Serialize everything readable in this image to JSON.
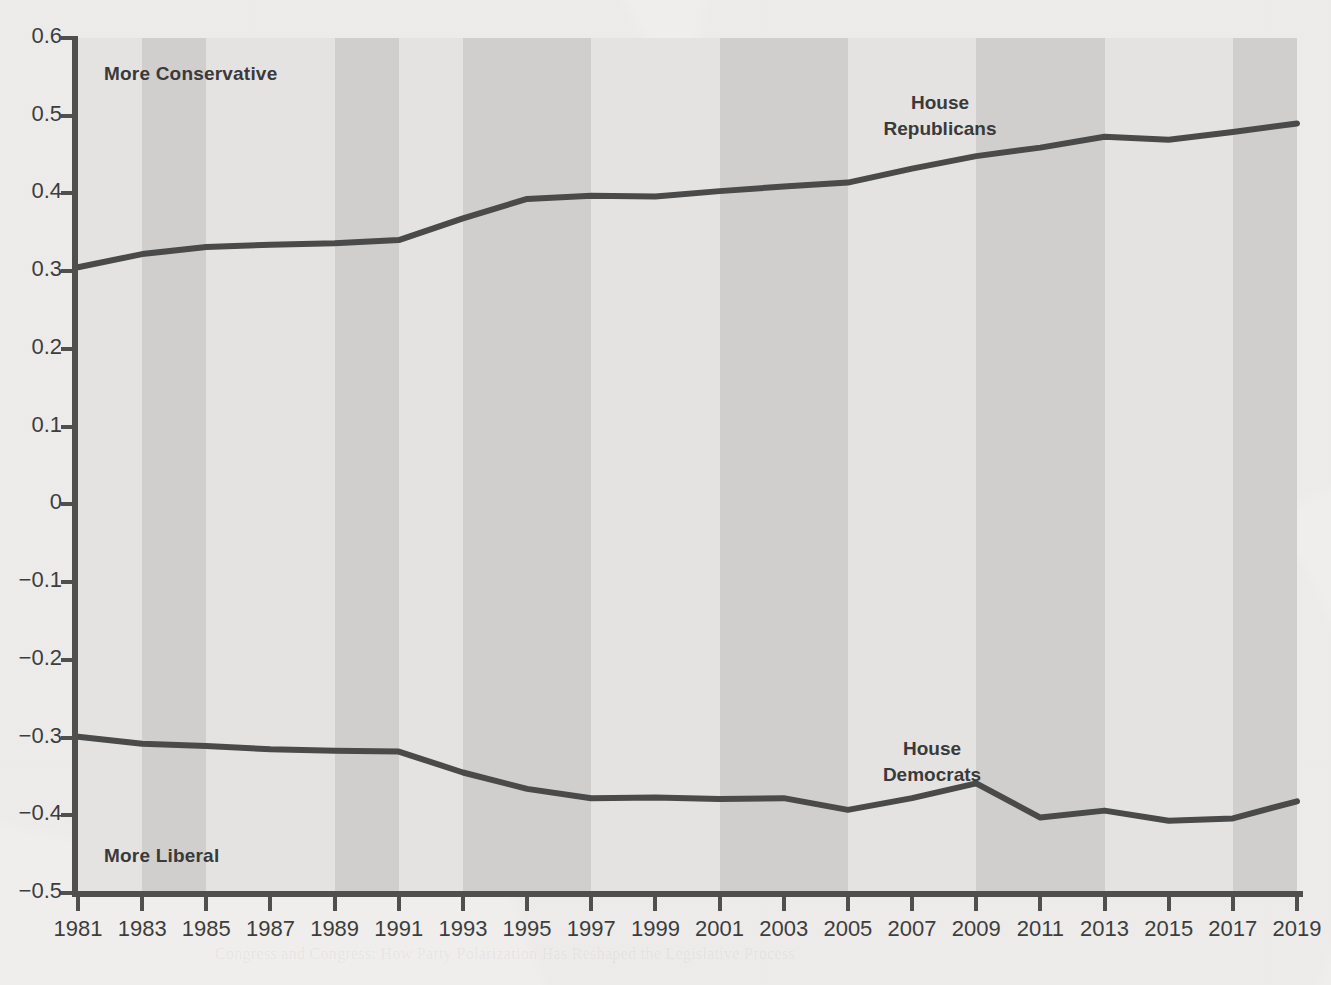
{
  "figure": {
    "background_color": "#efeeec",
    "band_light_color": "#e4e3e1",
    "band_dark_color": "#d0cfcd",
    "line_color": "#4a4a4a",
    "axis_color": "#4f4f4f"
  },
  "annotations": {
    "top_left": "More Conservative",
    "bottom_left": "More Liberal"
  },
  "series_labels": {
    "republicans_line1": "House",
    "republicans_line2": "Republicans",
    "democrats_line1": "House",
    "democrats_line2": "Democrats"
  },
  "ghost_text": {
    "g1": "Polarization and the Politics of Personal",
    "g2": "Responsibility in the Modern Congress",
    "g3": "increasingly divided along partisan lines",
    "g4": "ideological distance between the parties",
    "g5": "DID YOU KNOW?",
    "g6": "Congress and Congress: How Party Polarization Has Reshaped the Legislative Process"
  },
  "chart_data": {
    "type": "line",
    "title": "",
    "subtitle": "",
    "xlabel": "",
    "ylabel": "",
    "grid": false,
    "legend_position": "inline-labels",
    "xlim": [
      1981,
      2019
    ],
    "ylim": [
      -0.5,
      0.6
    ],
    "ytick_values": [
      0.6,
      0.5,
      0.4,
      0.3,
      0.2,
      0.1,
      0,
      -0.1,
      -0.2,
      -0.3,
      -0.4,
      -0.5
    ],
    "ytick_labels": [
      "0.6",
      "0.5",
      "0.4",
      "0.3",
      "0.2",
      "0.1",
      "0",
      "−0.1",
      "−0.2",
      "−0.3",
      "−0.4",
      "−0.5"
    ],
    "xtick_values": [
      1981,
      1983,
      1985,
      1987,
      1989,
      1991,
      1993,
      1995,
      1997,
      1999,
      2001,
      2003,
      2005,
      2007,
      2009,
      2011,
      2013,
      2015,
      2017,
      2019
    ],
    "xtick_labels": [
      "1981",
      "1983",
      "1985",
      "1987",
      "1989",
      "1991",
      "1993",
      "1995",
      "1997",
      "1999",
      "2001",
      "2003",
      "2005",
      "2007",
      "2009",
      "2011",
      "2013",
      "2015",
      "2017",
      "2019"
    ],
    "x": [
      1981,
      1983,
      1985,
      1987,
      1989,
      1991,
      1993,
      1995,
      1997,
      1999,
      2001,
      2003,
      2005,
      2007,
      2009,
      2011,
      2013,
      2015,
      2017,
      2019
    ],
    "series": [
      {
        "name": "House Republicans",
        "color": "#4a4a4a",
        "values": [
          0.305,
          0.322,
          0.331,
          0.334,
          0.336,
          0.34,
          0.368,
          0.393,
          0.397,
          0.396,
          0.403,
          0.409,
          0.414,
          0.432,
          0.448,
          0.459,
          0.473,
          0.469,
          0.479,
          0.49
        ]
      },
      {
        "name": "House Democrats",
        "color": "#4a4a4a",
        "values": [
          -0.299,
          -0.308,
          -0.311,
          -0.315,
          -0.317,
          -0.318,
          -0.345,
          -0.366,
          -0.378,
          -0.377,
          -0.379,
          -0.378,
          -0.393,
          -0.378,
          -0.359,
          -0.403,
          -0.394,
          -0.407,
          -0.404,
          -0.382
        ]
      }
    ],
    "bands": [
      {
        "start": 1981,
        "end": 1983,
        "shade": "light"
      },
      {
        "start": 1983,
        "end": 1985,
        "shade": "dark"
      },
      {
        "start": 1985,
        "end": 1987,
        "shade": "light"
      },
      {
        "start": 1987,
        "end": 1989,
        "shade": "light"
      },
      {
        "start": 1989,
        "end": 1991,
        "shade": "dark"
      },
      {
        "start": 1991,
        "end": 1993,
        "shade": "light"
      },
      {
        "start": 1993,
        "end": 1995,
        "shade": "dark"
      },
      {
        "start": 1995,
        "end": 1997,
        "shade": "dark"
      },
      {
        "start": 1997,
        "end": 1999,
        "shade": "light"
      },
      {
        "start": 1999,
        "end": 2001,
        "shade": "light"
      },
      {
        "start": 2001,
        "end": 2003,
        "shade": "dark"
      },
      {
        "start": 2003,
        "end": 2005,
        "shade": "dark"
      },
      {
        "start": 2005,
        "end": 2007,
        "shade": "light"
      },
      {
        "start": 2007,
        "end": 2009,
        "shade": "light"
      },
      {
        "start": 2009,
        "end": 2011,
        "shade": "dark"
      },
      {
        "start": 2011,
        "end": 2013,
        "shade": "dark"
      },
      {
        "start": 2013,
        "end": 2015,
        "shade": "light"
      },
      {
        "start": 2015,
        "end": 2017,
        "shade": "light"
      },
      {
        "start": 2017,
        "end": 2019,
        "shade": "dark"
      }
    ]
  }
}
